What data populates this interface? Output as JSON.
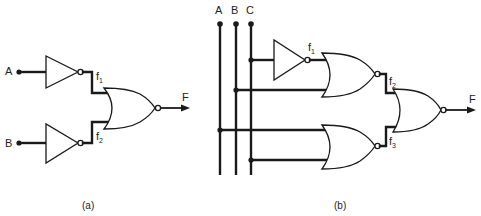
{
  "figure": {
    "colors": {
      "ink": "#1a1a1a",
      "background": "#ffffff"
    },
    "panel_a": {
      "caption": "(a)",
      "inputs": [
        {
          "label": "A"
        },
        {
          "label": "B"
        }
      ],
      "signals": [
        {
          "name": "f",
          "sub": "1"
        },
        {
          "name": "f",
          "sub": "2"
        }
      ],
      "output": "F",
      "gates": [
        "NOT",
        "NOT",
        "NOR"
      ]
    },
    "panel_b": {
      "caption": "(b)",
      "inputs": [
        {
          "label": "A"
        },
        {
          "label": "B"
        },
        {
          "label": "C"
        }
      ],
      "signals": [
        {
          "name": "f",
          "sub": "1"
        },
        {
          "name": "f",
          "sub": "2"
        },
        {
          "name": "f",
          "sub": "3"
        }
      ],
      "output": "F",
      "gates": [
        "NOT",
        "NOR",
        "NOR",
        "NOR"
      ]
    }
  }
}
